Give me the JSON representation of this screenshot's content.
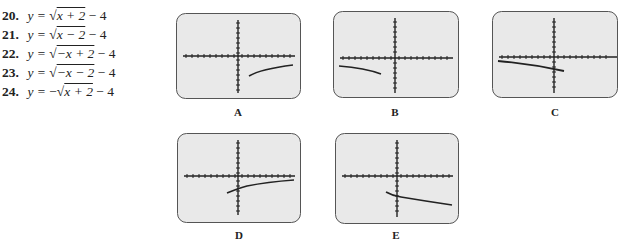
{
  "equations": [
    {
      "num": "20.",
      "lhs": "y = ",
      "neg": "",
      "radicand": "x + 2",
      "tail": " − 4"
    },
    {
      "num": "21.",
      "lhs": "y = ",
      "neg": "",
      "radicand": "x − 2",
      "tail": " − 4"
    },
    {
      "num": "22.",
      "lhs": "y = ",
      "neg": "",
      "radicand": "−x + 2",
      "tail": " − 4"
    },
    {
      "num": "23.",
      "lhs": "y = ",
      "neg": "",
      "radicand": "−x − 2",
      "tail": " − 4"
    },
    {
      "num": "24.",
      "lhs": "y = ",
      "neg": "−",
      "radicand": "x + 2",
      "tail": " − 4"
    }
  ],
  "sqrt_symbol": "√",
  "graphs": [
    {
      "label": "A",
      "description": "curve starting right of origin below x-axis, increasing slowly rightward"
    },
    {
      "label": "B",
      "description": "curve in left half below x-axis, decreasing toward the left-of-origin endpoint"
    },
    {
      "label": "C",
      "description": "curve from far left below x-axis decreasing to endpoint just right of y-axis"
    },
    {
      "label": "D",
      "description": "curve starting left of origin below x-axis, increasing slowly rightward"
    },
    {
      "label": "E",
      "description": "curve starting left of origin below x-axis, decreasing rightward"
    }
  ],
  "colors": {
    "screen_fill": "#e9e9e9",
    "screen_border": "#555555",
    "curve": "#222222"
  }
}
